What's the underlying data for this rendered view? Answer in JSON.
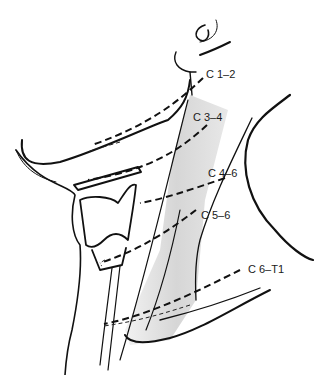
{
  "figure": {
    "colors": {
      "line": "#111111",
      "muscle_shade": "#dcdcdc",
      "background": "#ffffff"
    }
  },
  "levels": [
    {
      "id": "c1-2",
      "label": "C 1–2"
    },
    {
      "id": "c3-4",
      "label": "C 3–4"
    },
    {
      "id": "c4-6",
      "label": "C 4–6"
    },
    {
      "id": "c5-6",
      "label": "C 5–6"
    },
    {
      "id": "c6-t1",
      "label": "C 6–T1"
    }
  ]
}
